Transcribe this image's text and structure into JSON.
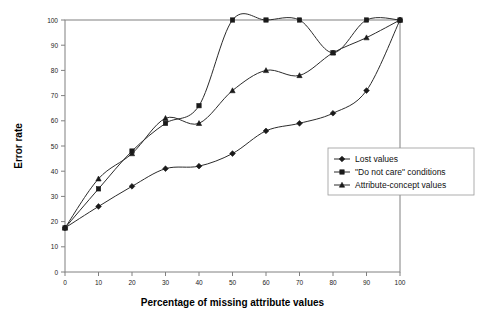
{
  "chart_data": {
    "type": "line",
    "title": "",
    "xlabel": "Percentage of missing attribute values",
    "ylabel": "Error rate",
    "xlim": [
      0,
      100
    ],
    "ylim": [
      0,
      100
    ],
    "xticks": [
      0,
      10,
      20,
      30,
      40,
      50,
      60,
      70,
      80,
      90,
      100
    ],
    "yticks": [
      0,
      10,
      20,
      30,
      40,
      50,
      60,
      70,
      80,
      90,
      100
    ],
    "grid": false,
    "legend_position": "center-right",
    "x": [
      0,
      10,
      20,
      30,
      40,
      50,
      60,
      70,
      80,
      90,
      100
    ],
    "series": [
      {
        "name": "Lost values",
        "marker": "diamond",
        "values": [
          17.5,
          26,
          34,
          41,
          42,
          47,
          56,
          59,
          63,
          72,
          100
        ]
      },
      {
        "name": "\"Do not care\" conditions",
        "marker": "square",
        "values": [
          17.5,
          33,
          48,
          59,
          66,
          100,
          100,
          100,
          87,
          100,
          100
        ]
      },
      {
        "name": "Attribute-concept values",
        "marker": "triangle",
        "values": [
          17.5,
          37,
          47,
          61,
          59,
          72,
          80,
          78,
          87,
          93,
          100
        ]
      }
    ],
    "tick_label_texts": {
      "x": [
        "0",
        "10",
        "20",
        "30",
        "40",
        "50",
        "60",
        "70",
        "80",
        "90",
        "100"
      ],
      "y": [
        "0",
        "10",
        "20",
        "30",
        "40",
        "50",
        "60",
        "70",
        "80",
        "90",
        "100"
      ]
    }
  },
  "legend": {
    "items": [
      {
        "label": "Lost values"
      },
      {
        "label": "\"Do not care\" conditions"
      },
      {
        "label": "Attribute-concept values"
      }
    ]
  },
  "colors": {
    "line": "#2b2b2b",
    "axis": "#808080",
    "text": "#000000",
    "background": "#ffffff"
  }
}
